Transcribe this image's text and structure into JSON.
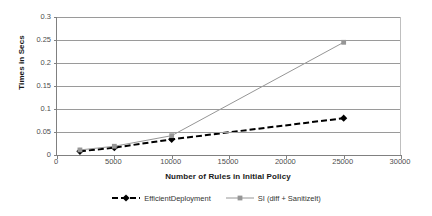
{
  "chart_data": {
    "type": "line",
    "title": "",
    "xlabel": "Number of Rules in Initial Policy",
    "ylabel": "Times in Secs",
    "xlim": [
      0,
      30000
    ],
    "ylim": [
      0,
      0.3
    ],
    "grid": true,
    "legend_position": "bottom",
    "x_ticks": [
      "0",
      "5000",
      "10000",
      "15000",
      "20000",
      "25000",
      "30000"
    ],
    "x_tick_values": [
      0,
      5000,
      10000,
      15000,
      20000,
      25000,
      30000
    ],
    "y_ticks": [
      "0",
      "0.05",
      "0.1",
      "0.15",
      "0.2",
      "0.25",
      "0.3"
    ],
    "y_tick_values": [
      0,
      0.05,
      0.1,
      0.15,
      0.2,
      0.25,
      0.3
    ],
    "x": [
      2000,
      5000,
      10000,
      25000
    ],
    "series": [
      {
        "name": "EfficientDeployment",
        "color": "#000000",
        "marker": "diamond",
        "dash": "dashed",
        "values": [
          0.008,
          0.016,
          0.034,
          0.08
        ]
      },
      {
        "name": "SI (diff + Sanitizelt)",
        "color": "#969696",
        "marker": "square",
        "dash": "solid",
        "values": [
          0.011,
          0.019,
          0.042,
          0.245
        ]
      }
    ]
  },
  "legend": {
    "items": [
      {
        "label": "EfficientDeployment"
      },
      {
        "label": "SI (diff + Sanitizelt)"
      }
    ]
  },
  "axes": {
    "y_title": "Times in Secs",
    "x_title": "Number of Rules in Initial Policy"
  },
  "colors": {
    "series_1": "#000000",
    "series_2": "#969696",
    "gridline": "#9a9a9a",
    "axis": "#808080",
    "background": "#ffffff"
  }
}
